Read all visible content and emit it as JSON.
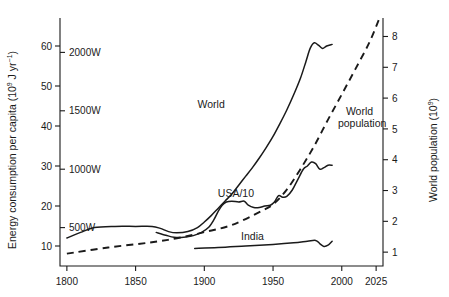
{
  "chart_data": {
    "type": "line",
    "title": "",
    "ylabel": "Energy consumption per capita (10⁹ J yr⁻¹)",
    "ylabel_main": "Energy consumption per capita (10",
    "ylabel_sup1": "9",
    "ylabel_mid": " J yr",
    "ylabel_sup2": "−1",
    "ylabel_end": ")",
    "y2label": "World population (10⁹)",
    "y2label_main": "World population (10",
    "y2label_sup": "9",
    "y2label_end": ")",
    "xlabel": "",
    "xlim": [
      1795,
      2030
    ],
    "ylim": [
      5,
      67
    ],
    "y2lim": [
      0.55,
      8.6
    ],
    "grid": false,
    "legend_position": "inline-labels",
    "xticks": [
      1800,
      1850,
      1900,
      1950,
      2000,
      2025
    ],
    "xticklabels": [
      "1800",
      "1850",
      "1900",
      "1950",
      "2000",
      "2025"
    ],
    "yticks": [
      10,
      20,
      30,
      40,
      50,
      60
    ],
    "yticklabels": [
      "10",
      "20",
      "30",
      "40",
      "50",
      "60"
    ],
    "y_power_ticks": [
      14.6,
      29.2,
      43.8,
      58.4
    ],
    "y_power_labels": [
      "500W",
      "1000W",
      "1500W",
      "2000W"
    ],
    "y2ticks": [
      1,
      2,
      3,
      4,
      5,
      6,
      7,
      8
    ],
    "y2ticklabels": [
      "1",
      "2",
      "3",
      "4",
      "5",
      "6",
      "7",
      "8"
    ],
    "series": [
      {
        "name": "World",
        "style": "solid",
        "axis": "left",
        "label": "World",
        "label_x": 1905,
        "label_y": 44.5,
        "points": [
          [
            1800,
            12.0
          ],
          [
            1810,
            13.4
          ],
          [
            1820,
            14.6
          ],
          [
            1835,
            14.9
          ],
          [
            1850,
            14.9
          ],
          [
            1862,
            14.9
          ],
          [
            1868,
            14.4
          ],
          [
            1874,
            13.6
          ],
          [
            1880,
            13.3
          ],
          [
            1888,
            13.6
          ],
          [
            1895,
            14.6
          ],
          [
            1900,
            16.0
          ],
          [
            1905,
            17.6
          ],
          [
            1910,
            19.4
          ],
          [
            1915,
            21.2
          ],
          [
            1920,
            23.0
          ],
          [
            1925,
            25.2
          ],
          [
            1930,
            27.4
          ],
          [
            1935,
            29.6
          ],
          [
            1940,
            32.0
          ],
          [
            1945,
            34.6
          ],
          [
            1950,
            37.4
          ],
          [
            1955,
            40.6
          ],
          [
            1960,
            44.0
          ],
          [
            1965,
            47.8
          ],
          [
            1970,
            52.0
          ],
          [
            1974,
            56.2
          ],
          [
            1977,
            59.4
          ],
          [
            1980,
            60.8
          ],
          [
            1983,
            60.2
          ],
          [
            1986,
            59.4
          ],
          [
            1989,
            60.0
          ],
          [
            1993,
            60.4
          ]
        ]
      },
      {
        "name": "USA/10",
        "style": "solid",
        "axis": "left",
        "label": "USA/10",
        "label_x": 1923,
        "label_y": 22.2,
        "points": [
          [
            1865,
            13.4
          ],
          [
            1872,
            12.7
          ],
          [
            1878,
            12.2
          ],
          [
            1885,
            12.2
          ],
          [
            1892,
            12.6
          ],
          [
            1898,
            13.4
          ],
          [
            1903,
            14.6
          ],
          [
            1907,
            16.6
          ],
          [
            1910,
            18.6
          ],
          [
            1913,
            20.2
          ],
          [
            1916,
            21.0
          ],
          [
            1920,
            21.2
          ],
          [
            1925,
            21.0
          ],
          [
            1929,
            21.2
          ],
          [
            1932,
            20.2
          ],
          [
            1936,
            19.6
          ],
          [
            1940,
            19.6
          ],
          [
            1944,
            20.0
          ],
          [
            1948,
            20.2
          ],
          [
            1951,
            21.0
          ],
          [
            1954,
            22.6
          ],
          [
            1957,
            22.2
          ],
          [
            1960,
            22.4
          ],
          [
            1964,
            24.0
          ],
          [
            1968,
            26.6
          ],
          [
            1972,
            29.2
          ],
          [
            1975,
            30.0
          ],
          [
            1978,
            31.0
          ],
          [
            1981,
            30.6
          ],
          [
            1984,
            29.2
          ],
          [
            1987,
            29.6
          ],
          [
            1990,
            30.2
          ],
          [
            1993,
            30.2
          ]
        ]
      },
      {
        "name": "India",
        "style": "solid",
        "axis": "left",
        "label": "India",
        "label_x": 1935,
        "label_y": 11.6,
        "points": [
          [
            1893,
            9.4
          ],
          [
            1910,
            9.6
          ],
          [
            1930,
            10.0
          ],
          [
            1950,
            10.4
          ],
          [
            1965,
            10.8
          ],
          [
            1975,
            11.2
          ],
          [
            1981,
            11.4
          ],
          [
            1984,
            10.6
          ],
          [
            1987,
            9.9
          ],
          [
            1990,
            10.2
          ],
          [
            1993,
            11.2
          ]
        ]
      },
      {
        "name": "World population",
        "style": "dashed",
        "axis": "right",
        "label": "World population",
        "label_line1": "World",
        "label_line2": "population",
        "label_x": 2003,
        "label_y_right": 5.45,
        "points_right": [
          [
            1800,
            0.95
          ],
          [
            1830,
            1.15
          ],
          [
            1860,
            1.31
          ],
          [
            1880,
            1.45
          ],
          [
            1900,
            1.65
          ],
          [
            1920,
            1.88
          ],
          [
            1940,
            2.3
          ],
          [
            1950,
            2.55
          ],
          [
            1960,
            3.03
          ],
          [
            1970,
            3.7
          ],
          [
            1980,
            4.45
          ],
          [
            1990,
            5.3
          ],
          [
            2000,
            6.12
          ],
          [
            2010,
            6.95
          ],
          [
            2020,
            7.8
          ],
          [
            2027,
            8.55
          ]
        ]
      }
    ]
  }
}
